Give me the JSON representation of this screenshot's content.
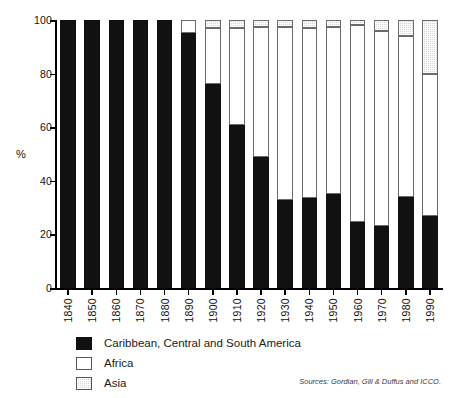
{
  "chart_data": {
    "type": "bar",
    "subtype": "stacked-percentage",
    "title": "",
    "xlabel": "",
    "ylabel": "%",
    "ylim": [
      0,
      100
    ],
    "yticks": [
      0,
      20,
      40,
      60,
      80,
      100
    ],
    "grid": false,
    "legend_position": "bottom-left",
    "categories": [
      "1840",
      "1850",
      "1860",
      "1870",
      "1880",
      "1890",
      "1900",
      "1910",
      "1920",
      "1930",
      "1940",
      "1950",
      "1960",
      "1970",
      "1980",
      "1990"
    ],
    "series": [
      {
        "name": "Caribbean, Central and South America",
        "color": "#111111",
        "values": [
          100,
          100,
          100,
          100,
          100,
          95,
          76,
          61,
          49,
          33,
          33.5,
          35,
          24.5,
          23,
          34,
          27
        ]
      },
      {
        "name": "Africa",
        "color": "#ffffff",
        "values": [
          0,
          0,
          0,
          0,
          0,
          5,
          21,
          36,
          48.5,
          64.5,
          63.5,
          62.5,
          73.5,
          73,
          60,
          53
        ]
      },
      {
        "name": "Asia",
        "color": "#d8d8d8",
        "values": [
          0,
          0,
          0,
          0,
          0,
          0,
          3,
          3,
          2.5,
          2.5,
          3,
          2.5,
          2,
          4,
          6,
          20
        ]
      }
    ],
    "source": "Sources: Gordian, Gill & Duffus and ICCO."
  },
  "axes": {
    "y_label": "%",
    "y_tick_labels": [
      "0",
      "20",
      "40",
      "60",
      "80",
      "100"
    ],
    "x_tick_labels": [
      "1840",
      "1850",
      "1860",
      "1870",
      "1880",
      "1890",
      "1900",
      "1910",
      "1920",
      "1930",
      "1940",
      "1950",
      "1960",
      "1970",
      "1980",
      "1990"
    ]
  },
  "legend": {
    "items": [
      {
        "label": "Caribbean, Central and South America",
        "swatch": "solid-black-swatch"
      },
      {
        "label": "Africa",
        "swatch": "outlined-white-swatch"
      },
      {
        "label": "Asia",
        "swatch": "hatched-gray-swatch"
      }
    ]
  },
  "footer": {
    "source_text": "Sources: Gordian, Gill & Duffus and ICCO."
  }
}
